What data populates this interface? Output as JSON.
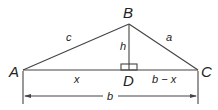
{
  "diagram": {
    "vertices": {
      "A": {
        "label": "A",
        "x": 23,
        "y": 70
      },
      "B": {
        "label": "B",
        "x": 129,
        "y": 24
      },
      "C": {
        "label": "C",
        "x": 198,
        "y": 70
      },
      "D": {
        "label": "D",
        "x": 129,
        "y": 70
      }
    },
    "sides": {
      "c": "c",
      "a": "a",
      "h": "h",
      "x": "x",
      "b_minus_x": "b − x",
      "b": "b"
    },
    "colors": {
      "line": "#444444",
      "text": "#222222",
      "background": "#ffffff"
    }
  }
}
